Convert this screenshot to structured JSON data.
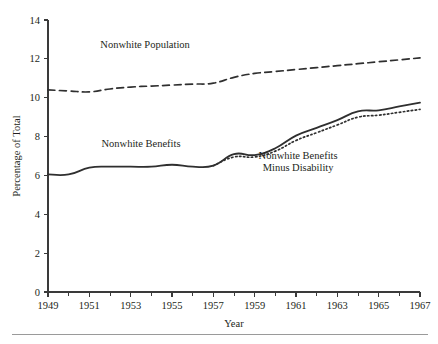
{
  "chart_data": {
    "type": "line",
    "title": "",
    "xlabel": "Year",
    "ylabel": "Percentage of Total",
    "xlim": [
      1949,
      1967
    ],
    "ylim": [
      0,
      14
    ],
    "grid": false,
    "legend_position": "inline-annotations",
    "x_ticks_major": [
      1949,
      1951,
      1953,
      1955,
      1957,
      1959,
      1961,
      1963,
      1965,
      1967
    ],
    "x_tick_labels": [
      "1949",
      "1951",
      "1953",
      "1955",
      "1957",
      "1959",
      "1961",
      "1963",
      "1965",
      "1967"
    ],
    "x_ticks_minor": [
      1950,
      1952,
      1954,
      1956,
      1958,
      1960,
      1962,
      1964,
      1966
    ],
    "y_ticks": [
      0,
      2,
      4,
      6,
      8,
      10,
      12,
      14
    ],
    "y_tick_labels": [
      "0",
      "2",
      "4",
      "6",
      "8",
      "10",
      "12",
      "14"
    ],
    "series": [
      {
        "name": "Nonwhite Population",
        "style": "dashed",
        "color": "#2f2f2f",
        "x": [
          1949,
          1950,
          1951,
          1952,
          1953,
          1954,
          1955,
          1956,
          1957,
          1958,
          1959,
          1960,
          1961,
          1962,
          1963,
          1964,
          1965,
          1966,
          1967
        ],
        "values": [
          10.4,
          10.35,
          10.3,
          10.45,
          10.55,
          10.6,
          10.65,
          10.7,
          10.75,
          11.05,
          11.25,
          11.35,
          11.45,
          11.55,
          11.65,
          11.75,
          11.85,
          11.95,
          12.05
        ],
        "annotation": {
          "text": "Nonwhite Population",
          "x": 1953.7,
          "y": 12.55
        }
      },
      {
        "name": "Nonwhite Benefits",
        "style": "solid",
        "color": "#2f2f2f",
        "x": [
          1949,
          1950,
          1951,
          1952,
          1953,
          1954,
          1955,
          1956,
          1957,
          1958,
          1959,
          1960,
          1961,
          1962,
          1963,
          1964,
          1965,
          1966,
          1967
        ],
        "values": [
          6.05,
          6.05,
          6.4,
          6.45,
          6.45,
          6.45,
          6.55,
          6.45,
          6.5,
          7.1,
          7.05,
          7.4,
          8.05,
          8.45,
          8.85,
          9.3,
          9.35,
          9.55,
          9.75
        ],
        "annotation": {
          "text": "Nonwhite Benefits",
          "x": 1953.5,
          "y": 7.45
        }
      },
      {
        "name": "Nonwhite Benefits Minus Disability",
        "style": "dotted",
        "color": "#2f2f2f",
        "x": [
          1957,
          1958,
          1959,
          1960,
          1961,
          1962,
          1963,
          1964,
          1965,
          1966,
          1967
        ],
        "values": [
          6.5,
          6.95,
          6.95,
          7.25,
          7.8,
          8.2,
          8.6,
          9.0,
          9.1,
          9.25,
          9.4
        ],
        "annotation": {
          "text_line1": "Nonwhite Benefits",
          "text_line2": "Minus Disability",
          "x": 1961.1,
          "y": 6.85
        }
      }
    ]
  },
  "figure": {
    "y_axis_title": "Percentage of Total",
    "x_axis_title": "Year",
    "label_population": "Nonwhite Population",
    "label_benefits": "Nonwhite Benefits",
    "label_minus_disability_line1": "Nonwhite Benefits",
    "label_minus_disability_line2": "Minus Disability",
    "y_labels": {
      "t0": "0",
      "t2": "2",
      "t4": "4",
      "t6": "6",
      "t8": "8",
      "t10": "10",
      "t12": "12",
      "t14": "14"
    },
    "x_labels": {
      "t1949": "1949",
      "t1951": "1951",
      "t1953": "1953",
      "t1955": "1955",
      "t1957": "1957",
      "t1959": "1959",
      "t1961": "1961",
      "t1963": "1963",
      "t1965": "1965",
      "t1967": "1967"
    },
    "colors": {
      "ink": "#231f20",
      "line": "#2f2f2f",
      "axis": "#3a3a3a",
      "rule": "#9a9a9a",
      "background": "#ffffff"
    }
  }
}
